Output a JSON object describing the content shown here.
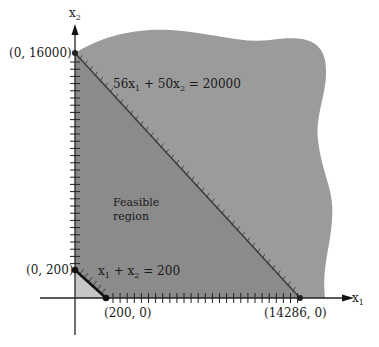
{
  "axes": {
    "x_label": "x",
    "x_sub": "1",
    "y_label": "x",
    "y_sub": "2"
  },
  "constraints": [
    {
      "equation_lhs_a": "56x",
      "a_sub": "1",
      "plus": " + 50x",
      "b_sub": "2",
      "rhs": " = 20000"
    },
    {
      "equation_lhs_a": "x",
      "a_sub": "1",
      "plus": " + x",
      "b_sub": "2",
      "rhs": " = 200"
    }
  ],
  "points": {
    "p_y_big": "(0, 16000)",
    "p_x_big": "(14286, 0)",
    "p_y_small": "(0, 200)",
    "p_x_small": "(200, 0)"
  },
  "region": {
    "line1": "Feasible",
    "line2": "region"
  },
  "colors": {
    "outer_region": "#9a9a9a",
    "feasible_region": "#8a8a8a",
    "small_triangle": "#c4c4c4",
    "axis": "#222222"
  }
}
